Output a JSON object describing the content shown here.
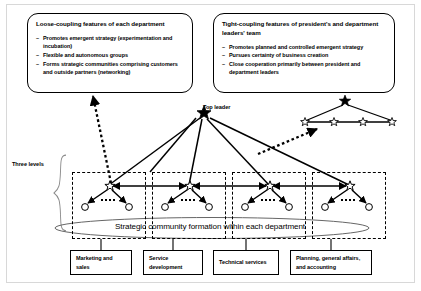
{
  "callouts": {
    "left": {
      "title": "Loose-coupling features of each department",
      "bullets": [
        "Promotes emergent strategy (experimentation and incubation)",
        "Flexible and autonomous groups",
        "Forms strategic communities comprising customers and outside partners (networking)"
      ]
    },
    "right": {
      "title": "Tight-coupling features of president's and department leaders' team",
      "bullets": [
        "Promotes planned and controlled emergent strategy",
        "Pursues certainty of business creation",
        "Close cooperation primarily between president and department leaders"
      ]
    }
  },
  "labels": {
    "top_leader": "Top leader",
    "three_levels": "Three levels",
    "ellipse": "Strategic community formation within each department"
  },
  "departments": [
    {
      "name": "Marketing and sales"
    },
    {
      "name": "Service development"
    },
    {
      "name": "Technical services"
    },
    {
      "name": "Planning, general affairs, and accounting"
    }
  ],
  "colors": {
    "stroke": "#000000",
    "frame": "#d8d8d8",
    "background": "#ffffff"
  },
  "nodes": {
    "top_leader_star": "filled-star",
    "department_leader_star": "hollow-star",
    "member_node": "hollow-circle",
    "president_team_lead_star": "filled-star",
    "president_team_member_star": "hollow-star"
  }
}
